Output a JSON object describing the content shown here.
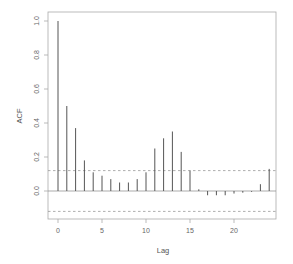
{
  "chart_data": {
    "type": "bar",
    "subtype": "acf-correlogram",
    "title": "",
    "xlabel": "Lag",
    "ylabel": "ACF",
    "x": [
      0,
      1,
      2,
      3,
      4,
      5,
      6,
      7,
      8,
      9,
      10,
      11,
      12,
      13,
      14,
      15,
      16,
      17,
      18,
      19,
      20,
      21,
      22,
      23,
      24
    ],
    "values": [
      1.0,
      0.5,
      0.37,
      0.18,
      0.11,
      0.09,
      0.07,
      0.05,
      0.05,
      0.07,
      0.11,
      0.25,
      0.31,
      0.35,
      0.23,
      0.12,
      0.01,
      -0.025,
      -0.025,
      -0.025,
      -0.015,
      -0.01,
      -0.005,
      0.04,
      0.13
    ],
    "confidence_bounds": [
      0.12,
      -0.12
    ],
    "xlim": [
      -1,
      25
    ],
    "ylim": [
      -0.17,
      1.04
    ],
    "xticks": [
      0,
      5,
      10,
      15,
      20
    ],
    "xtick_labels": [
      "0",
      "5",
      "10",
      "15",
      "20"
    ],
    "yticks": [
      0.0,
      0.2,
      0.4,
      0.6,
      0.8,
      1.0
    ],
    "ytick_labels": [
      "0.0",
      "0.2",
      "0.4",
      "0.6",
      "0.8",
      "1.0"
    ],
    "grid": false,
    "legend": null,
    "colors": {
      "bars": "#555555",
      "frame": "#aaaaaa",
      "confidence": "#999999",
      "zero_line": "#888888"
    }
  }
}
